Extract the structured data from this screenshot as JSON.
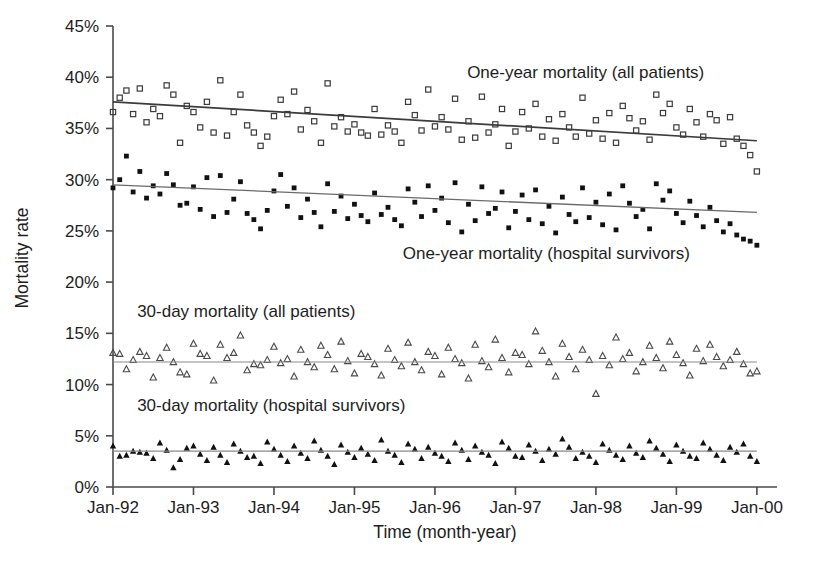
{
  "chart_data": {
    "type": "scatter",
    "title": "",
    "xlabel": "Time (month-year)",
    "ylabel": "Mortality rate",
    "grid": false,
    "legend_position": "inline-annotations",
    "xlim": [
      1992.0,
      2000.25
    ],
    "ylim": [
      0,
      45
    ],
    "y_tick_labels": [
      "0%",
      "5%",
      "10%",
      "15%",
      "20%",
      "25%",
      "30%",
      "35%",
      "40%",
      "45%"
    ],
    "y_tick_values": [
      0,
      5,
      10,
      15,
      20,
      25,
      30,
      35,
      40,
      45
    ],
    "x_tick_labels": [
      "Jan-92",
      "Jan-93",
      "Jan-94",
      "Jan-95",
      "Jan-96",
      "Jan-97",
      "Jan-98",
      "Jan-99",
      "Jan-00"
    ],
    "x_tick_values": [
      1992,
      1993,
      1994,
      1995,
      1996,
      1997,
      1998,
      1999,
      2000
    ],
    "series": [
      {
        "name": "One-year mortality (all patients)",
        "marker": "open-square",
        "color": "#3b3b3b",
        "trend": {
          "x0": 1992.0,
          "y0": 37.6,
          "x1": 2000.0,
          "y1": 33.8,
          "color": "#3b3b3b",
          "width": 1.7
        },
        "values": [
          36.6,
          38.0,
          38.7,
          36.4,
          38.9,
          35.6,
          36.9,
          36.2,
          39.2,
          38.3,
          33.6,
          37.2,
          36.6,
          35.1,
          37.6,
          34.6,
          39.7,
          34.3,
          36.6,
          38.3,
          35.3,
          34.6,
          33.3,
          34.2,
          36.2,
          37.8,
          36.4,
          38.6,
          34.9,
          36.8,
          35.7,
          33.6,
          39.4,
          35.2,
          36.1,
          34.7,
          35.4,
          34.6,
          34.3,
          36.9,
          34.4,
          35.3,
          34.7,
          33.6,
          37.6,
          36.3,
          34.8,
          38.8,
          35.2,
          36.1,
          34.9,
          37.9,
          33.9,
          35.7,
          34.1,
          38.1,
          34.6,
          35.4,
          36.9,
          33.3,
          34.7,
          36.6,
          35.0,
          37.4,
          34.2,
          35.9,
          33.8,
          36.4,
          35.1,
          34.2,
          38.0,
          34.5,
          35.8,
          34.0,
          36.5,
          33.6,
          37.2,
          36.0,
          34.8,
          35.7,
          33.9,
          38.3,
          36.5,
          37.4,
          35.1,
          34.4,
          36.9,
          35.6,
          34.2,
          36.4,
          35.8,
          33.5,
          36.1,
          34.0,
          33.3,
          32.4,
          30.8
        ]
      },
      {
        "name": "One-year mortality (hospital survivors)",
        "marker": "filled-square",
        "color": "#111111",
        "trend": {
          "x0": 1992.0,
          "y0": 29.5,
          "x1": 2000.0,
          "y1": 26.8,
          "color": "#6a6a6a",
          "width": 1.3
        },
        "values": [
          29.2,
          30.0,
          32.3,
          28.8,
          30.8,
          28.2,
          29.4,
          28.6,
          30.6,
          29.5,
          27.5,
          27.7,
          29.3,
          27.1,
          30.2,
          26.4,
          30.4,
          26.8,
          28.1,
          29.8,
          26.7,
          26.1,
          25.2,
          27.0,
          28.9,
          30.5,
          27.4,
          29.2,
          26.3,
          28.1,
          26.8,
          25.4,
          29.6,
          26.9,
          28.4,
          26.2,
          27.6,
          26.5,
          25.9,
          28.7,
          26.6,
          27.3,
          26.1,
          25.5,
          29.1,
          27.8,
          26.4,
          29.4,
          27.0,
          28.2,
          25.8,
          29.7,
          24.9,
          27.6,
          26.0,
          29.3,
          26.7,
          27.2,
          28.8,
          25.3,
          26.9,
          28.5,
          26.1,
          29.0,
          25.7,
          27.4,
          24.8,
          28.3,
          26.6,
          25.9,
          29.2,
          26.3,
          27.8,
          25.6,
          28.6,
          25.1,
          29.4,
          27.7,
          26.4,
          27.1,
          25.2,
          29.6,
          28.0,
          28.9,
          26.7,
          25.8,
          27.9,
          26.5,
          25.4,
          27.3,
          26.0,
          24.9,
          25.7,
          24.6,
          24.2,
          24.0,
          23.6
        ]
      },
      {
        "name": "30-day mortality (all patients)",
        "marker": "open-triangle",
        "color": "#4a4a4a",
        "trend": {
          "x0": 1992.0,
          "y0": 12.2,
          "x1": 2000.0,
          "y1": 12.2,
          "color": "#8a8a8a",
          "width": 1.2
        },
        "values": [
          13.1,
          13.0,
          11.5,
          12.4,
          13.2,
          12.8,
          10.7,
          12.6,
          13.6,
          12.2,
          11.2,
          11.0,
          14.0,
          13.0,
          12.8,
          10.4,
          13.9,
          12.6,
          13.1,
          14.8,
          11.4,
          12.0,
          11.9,
          12.4,
          13.7,
          12.1,
          12.5,
          10.8,
          13.4,
          12.2,
          11.7,
          13.8,
          12.9,
          11.5,
          14.2,
          12.3,
          11.1,
          13.0,
          12.7,
          12.0,
          10.9,
          13.5,
          12.4,
          11.8,
          14.1,
          12.2,
          11.4,
          13.2,
          12.8,
          11.0,
          13.6,
          12.5,
          12.1,
          10.6,
          13.9,
          12.3,
          11.7,
          14.4,
          12.6,
          11.2,
          13.1,
          12.9,
          12.0,
          15.2,
          13.3,
          12.2,
          10.8,
          14.0,
          12.7,
          11.5,
          13.4,
          12.4,
          9.1,
          12.8,
          11.9,
          14.6,
          12.5,
          13.1,
          11.3,
          12.2,
          13.8,
          12.6,
          11.6,
          14.2,
          12.9,
          12.1,
          10.9,
          13.5,
          12.3,
          13.9,
          12.7,
          11.8,
          12.4,
          13.2,
          12.0,
          11.1,
          11.3
        ]
      },
      {
        "name": "30-day mortality (hospital survivors)",
        "marker": "filled-triangle",
        "color": "#111111",
        "trend": {
          "x0": 1992.0,
          "y0": 3.5,
          "x1": 2000.0,
          "y1": 3.5,
          "color": "#8a8a8a",
          "width": 1.2
        },
        "values": [
          4.0,
          3.0,
          3.1,
          3.5,
          3.4,
          3.3,
          2.8,
          4.3,
          3.6,
          1.9,
          2.7,
          3.8,
          4.0,
          3.2,
          2.6,
          3.9,
          3.1,
          2.4,
          4.2,
          3.5,
          2.9,
          3.0,
          2.3,
          4.4,
          3.7,
          3.1,
          2.5,
          4.0,
          3.3,
          2.8,
          4.5,
          3.6,
          3.0,
          2.2,
          4.1,
          3.4,
          2.9,
          3.8,
          3.2,
          2.6,
          4.6,
          3.5,
          3.1,
          2.4,
          4.2,
          3.7,
          2.8,
          3.9,
          3.3,
          3.0,
          2.5,
          4.3,
          3.6,
          2.7,
          4.0,
          3.4,
          3.1,
          2.3,
          4.4,
          3.8,
          3.0,
          2.9,
          4.1,
          3.5,
          2.6,
          3.7,
          3.2,
          4.7,
          3.9,
          2.8,
          3.4,
          3.0,
          2.4,
          4.2,
          3.6,
          3.1,
          2.7,
          4.0,
          3.3,
          2.9,
          4.5,
          3.8,
          3.2,
          2.5,
          4.1,
          3.5,
          3.0,
          2.8,
          4.3,
          3.7,
          3.1,
          2.6,
          3.9,
          3.4,
          4.2,
          3.0,
          2.5
        ]
      }
    ],
    "annotations": [
      {
        "text": "One-year mortality (all patients)",
        "x": 1996.4,
        "y": 39.9
      },
      {
        "text": "One-year mortality (hospital survivors)",
        "x": 1995.6,
        "y": 22.3
      },
      {
        "text": "30-day mortality (all patients)",
        "x": 1992.3,
        "y": 16.6
      },
      {
        "text": "30-day mortality (hospital survivors)",
        "x": 1992.3,
        "y": 7.4
      }
    ]
  }
}
